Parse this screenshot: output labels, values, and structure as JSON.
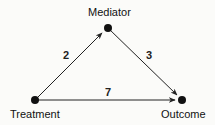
{
  "diagram": {
    "type": "mediation-path-diagram",
    "nodes": [
      {
        "id": "treatment",
        "label": "Treatment",
        "x": 35,
        "y": 100
      },
      {
        "id": "mediator",
        "label": "Mediator",
        "x": 108,
        "y": 28
      },
      {
        "id": "outcome",
        "label": "Outcome",
        "x": 182,
        "y": 100
      }
    ],
    "edges": [
      {
        "from": "treatment",
        "to": "mediator",
        "label": "2"
      },
      {
        "from": "mediator",
        "to": "outcome",
        "label": "3"
      },
      {
        "from": "treatment",
        "to": "outcome",
        "label": "7"
      }
    ],
    "colors": {
      "line": "#222222",
      "node": "#111111",
      "background": "#fbfbf9"
    }
  }
}
